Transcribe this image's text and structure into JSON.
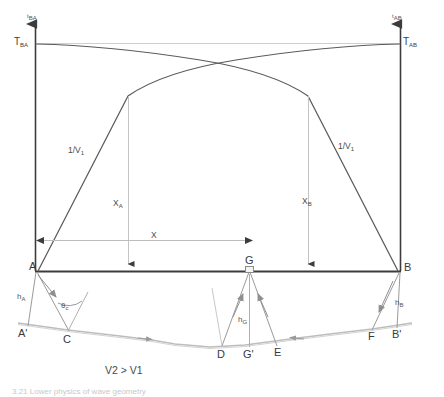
{
  "figure": {
    "type": "seismic-refraction-travel-time-diagram",
    "axes": {
      "left_axis_tick_label": "t",
      "left_axis_tick_sub": "BA",
      "right_axis_tick_label": "t",
      "right_axis_tick_sub": "AB",
      "left_intercept_label": "T",
      "left_intercept_sub": "BA",
      "right_intercept_label": "T",
      "right_intercept_sub": "AB"
    },
    "slope_labels": [
      {
        "text": "1/V",
        "sub": "1"
      },
      {
        "text": "1/V",
        "sub": "1"
      }
    ],
    "distance_labels": [
      {
        "text": "X",
        "sub": "A"
      },
      {
        "text": "X",
        "sub": ""
      },
      {
        "text": "X",
        "sub": "B"
      }
    ],
    "surface_points": [
      {
        "label": "A",
        "sub": ""
      },
      {
        "label": "A'",
        "sub": ""
      },
      {
        "label": "C",
        "sub": ""
      },
      {
        "label": "D",
        "sub": ""
      },
      {
        "label": "G",
        "sub": ""
      },
      {
        "label": "G'",
        "sub": ""
      },
      {
        "label": "E",
        "sub": ""
      },
      {
        "label": "F",
        "sub": ""
      },
      {
        "label": "B",
        "sub": ""
      },
      {
        "label": "B'",
        "sub": ""
      }
    ],
    "depth_labels": [
      {
        "text": "h",
        "sub": "A"
      },
      {
        "text": "h",
        "sub": "G"
      },
      {
        "text": "h",
        "sub": "B"
      }
    ],
    "angle_label": {
      "text": "θ",
      "sub": "c"
    },
    "caption": "V2 > V1",
    "footer_caption": "3.21 Lower physics of wave geometry",
    "colors": {
      "curve": "#5a5a5a",
      "axis": "#3c3c3c",
      "guide": "#b9b9b9",
      "ground": "#bdbdbd",
      "ray": "#9a9a9a",
      "text": "#3a3a3a"
    }
  }
}
